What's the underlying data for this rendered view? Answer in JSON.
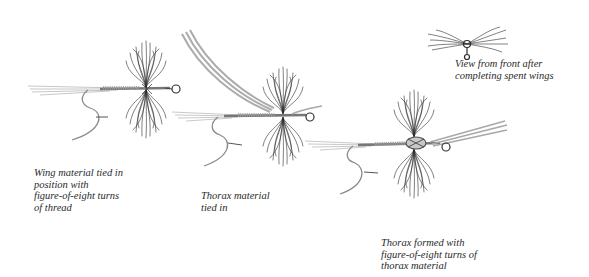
{
  "figure": {
    "steps": [
      {
        "id": "step-1",
        "caption": "Wing material tied in\nposition with\nfigure-of-eight turns\nof thread"
      },
      {
        "id": "step-2",
        "caption": "Thorax material\ntied in"
      },
      {
        "id": "step-3",
        "caption": "Thorax formed with\nfigure-of-eight turns of\nthorax material"
      },
      {
        "id": "front-view",
        "caption": "View from front after\ncompleting spent wings"
      }
    ],
    "colors": {
      "hackle": "#2b2b2b",
      "hook": "#6a6a6a",
      "thread": "#8a8a8a",
      "thorax_material": "#9a9a9a",
      "background": "#ffffff"
    }
  }
}
